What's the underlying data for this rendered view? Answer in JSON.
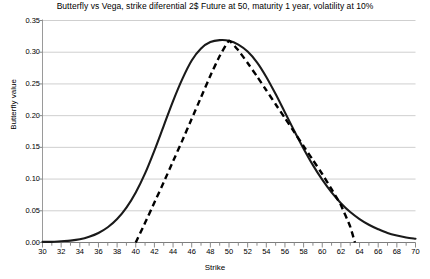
{
  "chart_data": {
    "type": "line",
    "title": "Butterfly vs Vega, strike diferential 2$ Future at 50, maturity 1 year, volatility at 10%",
    "xlabel": "Strike",
    "ylabel": "Butterfly value",
    "xlim": [
      30,
      70
    ],
    "ylim": [
      0.0,
      0.35
    ],
    "grid": true,
    "grid_axis": "y",
    "legend": null,
    "x_major_step": 2,
    "x_minor_step": 1,
    "y_major_step": 0.05,
    "xticks": [
      30,
      32,
      34,
      36,
      38,
      40,
      42,
      44,
      46,
      48,
      50,
      52,
      54,
      56,
      58,
      60,
      62,
      64,
      66,
      68,
      70
    ],
    "xtick_labels": [
      "30",
      "32",
      "34",
      "36",
      "38",
      "40",
      "42",
      "44",
      "46",
      "48",
      "50",
      "52",
      "54",
      "56",
      "58",
      "60",
      "62",
      "64",
      "66",
      "68",
      "70"
    ],
    "yticks": [
      0.0,
      0.05,
      0.1,
      0.15,
      0.2,
      0.25,
      0.3,
      0.35
    ],
    "ytick_labels": [
      "0.00",
      "0.05",
      "0.10",
      "0.15",
      "0.20",
      "0.25",
      "0.30",
      "0.35"
    ],
    "series": [
      {
        "name": "Butterfly",
        "style": "solid",
        "color": "#1a1a1a",
        "width": 2.1,
        "x": [
          30,
          31,
          32,
          33,
          34,
          35,
          36,
          37,
          38,
          39,
          40,
          41,
          42,
          43,
          44,
          45,
          46,
          47,
          48,
          49,
          50,
          51,
          52,
          53,
          54,
          55,
          56,
          57,
          58,
          59,
          60,
          61,
          62,
          63,
          64,
          65,
          66,
          67,
          68,
          69,
          70
        ],
        "y": [
          0.001,
          0.001,
          0.002,
          0.003,
          0.005,
          0.009,
          0.015,
          0.024,
          0.037,
          0.055,
          0.079,
          0.109,
          0.145,
          0.184,
          0.223,
          0.258,
          0.287,
          0.306,
          0.316,
          0.319,
          0.318,
          0.312,
          0.301,
          0.284,
          0.261,
          0.234,
          0.205,
          0.176,
          0.148,
          0.122,
          0.099,
          0.079,
          0.062,
          0.048,
          0.037,
          0.028,
          0.021,
          0.015,
          0.011,
          0.008,
          0.006
        ]
      },
      {
        "name": "Vega",
        "style": "dashed",
        "color": "#000000",
        "width": 2.4,
        "dash": "6,4",
        "x": [
          40,
          41,
          42,
          43,
          44,
          45,
          46,
          47,
          48,
          49,
          50,
          51,
          52,
          53,
          54,
          55,
          56,
          57,
          58,
          59,
          60,
          61,
          62,
          63,
          63.5
        ],
        "y": [
          0.0,
          0.031,
          0.063,
          0.095,
          0.128,
          0.161,
          0.195,
          0.229,
          0.263,
          0.294,
          0.318,
          0.303,
          0.283,
          0.262,
          0.24,
          0.218,
          0.196,
          0.174,
          0.152,
          0.13,
          0.108,
          0.084,
          0.059,
          0.025,
          0.0
        ]
      }
    ],
    "peak": {
      "x": 50,
      "y": 0.318
    }
  }
}
